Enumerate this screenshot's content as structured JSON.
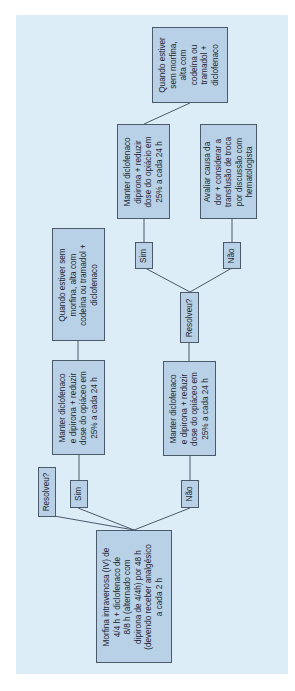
{
  "diagram": {
    "orientation": "rotated-90-ccw",
    "colors": {
      "panel_bg": "#dcedf8",
      "node_fill": "#b9d1e6",
      "node_border": "#4a5a6a",
      "connector": "#4a5a6a",
      "text": "#1c2630"
    },
    "nodes": {
      "start": {
        "label": "Morfina intravenosa (IV) de 4/4 h + diclofenaco de 8/8 h (alternado com dipirona de 4/4h) por 48 h (devendo receber analgésico a cada 2 h",
        "lines": [
          "Morfina intravenosa (IV) de",
          "4/4 h + diclofenaco de",
          "8/8 h (alternado com",
          "dipirona de 4/4h) por 48 h",
          "(devendo receber analgésico",
          "a cada 2 h"
        ]
      },
      "q1": {
        "label": "Resolveu?"
      },
      "q1_yes": {
        "label": "Sim"
      },
      "q1_no": {
        "label": "Não"
      },
      "reduce_a": {
        "lines": [
          "Manter diclofenaco",
          "e dipirona + reduzir",
          "dose do opiáceo em",
          "25% a cada 24 h"
        ]
      },
      "discharge_a": {
        "lines": [
          "Quando estiver sem",
          "morfina, alta com",
          "codeína ou tramadol +",
          "diclofenaco"
        ]
      },
      "reduce_b": {
        "lines": [
          "Manter diclofenaco",
          "e dipirona + reduzir",
          "dose do opiáceo em",
          "25% a cada 24 h"
        ]
      },
      "q2": {
        "label": "Resolveu?"
      },
      "q2_yes": {
        "label": "Sim"
      },
      "q2_no": {
        "label": "Não"
      },
      "reduce_c": {
        "lines": [
          "Manter diclofenaco",
          "dipirona + reduzir",
          "dose do opiácio em",
          "25% a cada 24 h"
        ]
      },
      "evaluate": {
        "lines": [
          "Avaliar causa da",
          "dor + considerar a",
          "transfusão de troca",
          "por discussão com",
          "hematologista"
        ]
      },
      "discharge_b": {
        "lines": [
          "Quando estiver",
          "sem morfina,",
          "alta com",
          "codeína ou",
          "tramadol +",
          "diclofenaco"
        ]
      }
    },
    "edges": [
      [
        "start",
        "q1"
      ],
      [
        "start",
        "q1_yes"
      ],
      [
        "start",
        "q1_no"
      ],
      [
        "q1_yes",
        "reduce_a"
      ],
      [
        "reduce_a",
        "discharge_a"
      ],
      [
        "q1_no",
        "reduce_b"
      ],
      [
        "reduce_b",
        "q2"
      ],
      [
        "q2",
        "q2_yes"
      ],
      [
        "q2",
        "q2_no"
      ],
      [
        "q2_yes",
        "reduce_c"
      ],
      [
        "reduce_c",
        "discharge_b"
      ],
      [
        "q2_no",
        "evaluate"
      ]
    ]
  }
}
